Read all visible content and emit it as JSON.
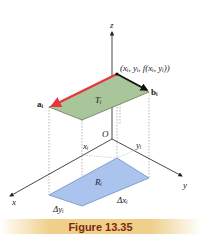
{
  "caption": "Figure 13.35",
  "labels": {
    "z_axis": "z",
    "y_axis": "y",
    "x_axis": "x",
    "origin": "O",
    "point": "(xᵢ, yᵢ, f(xᵢ, yᵢ))",
    "vector_a": "aᵢ",
    "vector_b": "bᵢ",
    "tangent_patch": "Tᵢ",
    "region": "Rᵢ",
    "x_i": "xᵢ",
    "y_i": "yᵢ",
    "delta_x": "Δxᵢ",
    "delta_y": "Δyᵢ"
  },
  "colors": {
    "tangent_fill": "#a9c69a",
    "tangent_stroke": "#5f7f55",
    "region_fill": "#aac4ee",
    "region_stroke": "#6f8fc4",
    "vector_a": "#e8343c",
    "vector_b": "#111111",
    "axis": "#333333",
    "caption_bg": "#efcf8a",
    "caption_text": "#7a2a10"
  }
}
